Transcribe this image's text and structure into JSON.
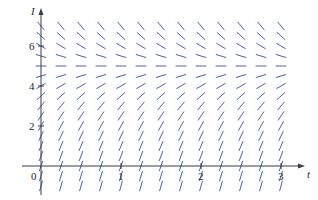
{
  "chart_data": {
    "type": "slope-field",
    "title": "",
    "equation_model": "dI/dt = k(5 - I)",
    "k": 2.4,
    "equilibrium": 5,
    "xlabel": "t",
    "ylabel": "I",
    "xlim": [
      0,
      3.3
    ],
    "ylim": [
      -1.2,
      7.8
    ],
    "x_ticks": [
      {
        "value": 0,
        "label": "0"
      },
      {
        "value": 1,
        "label": "1"
      },
      {
        "value": 2,
        "label": "2"
      },
      {
        "value": 3,
        "label": "3"
      }
    ],
    "y_ticks": [
      {
        "value": 2,
        "label": "2"
      },
      {
        "value": 4,
        "label": "4"
      },
      {
        "value": 6,
        "label": "6"
      }
    ],
    "grid_t": {
      "start": 0,
      "end": 3,
      "step": 0.25
    },
    "grid_I": {
      "start": -1,
      "end": 7,
      "step": 0.5
    },
    "colors": {
      "segments": "#4a63b0",
      "axes": "#3a3d4a"
    }
  }
}
